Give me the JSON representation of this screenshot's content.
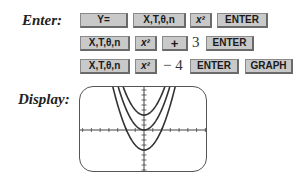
{
  "labels": {
    "enter": "Enter:",
    "display": "Display:"
  },
  "rows": [
    {
      "keys": [
        {
          "id": "y-equals",
          "label": "Y="
        },
        {
          "id": "xt-theta-n",
          "label": "X,T,θ,n"
        },
        {
          "id": "x-squared",
          "label": "x²"
        },
        {
          "id": "enter",
          "label": "ENTER"
        }
      ]
    },
    {
      "keys": [
        {
          "id": "xt-theta-n",
          "label": "X,T,θ,n"
        },
        {
          "id": "x-squared",
          "label": "x²"
        },
        {
          "id": "plus",
          "label": "+"
        },
        {
          "id": "enter",
          "label": "ENTER"
        }
      ],
      "typed": "3"
    },
    {
      "keys": [
        {
          "id": "xt-theta-n",
          "label": "X,T,θ,n"
        },
        {
          "id": "x-squared",
          "label": "x²"
        },
        {
          "id": "enter",
          "label": "ENTER"
        },
        {
          "id": "graph",
          "label": "GRAPH"
        }
      ],
      "typed": "− 4"
    }
  ],
  "display": {
    "functions": [
      "x^2 + 3",
      "x^2",
      "x^2 - 4"
    ],
    "window": {
      "xmin": -7.3,
      "xmax": 7.3,
      "xscl": 1,
      "ymin": -8.6,
      "ymax": 8.6,
      "yscl": 1
    }
  },
  "colors": {
    "key_face": "#c9c9c9",
    "key_border": "#6a6a6a",
    "curve": "#333333",
    "axis": "#444444"
  }
}
